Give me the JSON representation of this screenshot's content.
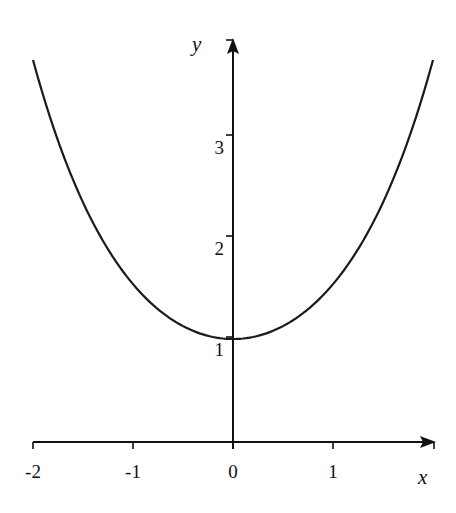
{
  "chart_data": {
    "type": "line",
    "title": "",
    "xlabel": "x",
    "ylabel": "y",
    "xlim": [
      -2,
      2
    ],
    "ylim": [
      0,
      4
    ],
    "grid": false,
    "legend": null,
    "x_ticks": [
      {
        "value": -2,
        "label": "-2"
      },
      {
        "value": -1,
        "label": "-1"
      },
      {
        "value": 0,
        "label": "0"
      },
      {
        "value": 1,
        "label": "1"
      }
    ],
    "y_ticks": [
      {
        "value": 1,
        "label": "1"
      },
      {
        "value": 2,
        "label": "2"
      },
      {
        "value": 3,
        "label": "3"
      }
    ],
    "series": [
      {
        "name": "y = cosh(x)",
        "x": [
          -2,
          -1.75,
          -1.5,
          -1.25,
          -1,
          -0.75,
          -0.5,
          -0.25,
          0,
          0.25,
          0.5,
          0.75,
          1,
          1.25,
          1.5,
          1.75,
          2
        ],
        "y": [
          3.76,
          2.96,
          2.35,
          1.89,
          1.54,
          1.29,
          1.13,
          1.03,
          1.0,
          1.03,
          1.13,
          1.29,
          1.54,
          1.89,
          2.35,
          2.96,
          3.76
        ]
      }
    ]
  },
  "style": {
    "axis_color": "#111111",
    "curve_color": "#1a1a1a",
    "background": "#ffffff"
  }
}
